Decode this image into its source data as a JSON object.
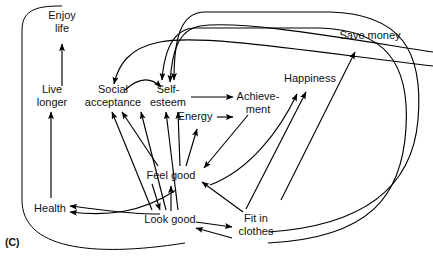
{
  "figure": {
    "panel_label": "(C)",
    "type": "causal-loop-diagram",
    "background_color": "#ffffff",
    "line_color": "#000000",
    "text_color": "#111111"
  },
  "nodes": [
    {
      "id": "enjoy-life",
      "lines": [
        "Enjoy",
        "life"
      ],
      "x": 62,
      "y": 22
    },
    {
      "id": "live-longer",
      "lines": [
        "Live",
        "longer"
      ],
      "x": 52,
      "y": 96
    },
    {
      "id": "social-acceptance",
      "lines": [
        "Social",
        "acceptance"
      ],
      "x": 113,
      "y": 96
    },
    {
      "id": "self-esteem",
      "lines": [
        "Self-",
        "esteem"
      ],
      "x": 168,
      "y": 96
    },
    {
      "id": "energy",
      "lines": [
        "Energy"
      ],
      "x": 195,
      "y": 117
    },
    {
      "id": "achievement",
      "lines": [
        "Achieve-",
        "ment"
      ],
      "x": 258,
      "y": 103
    },
    {
      "id": "happiness",
      "lines": [
        "Happiness"
      ],
      "x": 310,
      "y": 79
    },
    {
      "id": "save-money",
      "lines": [
        "Save money"
      ],
      "x": 370,
      "y": 36
    },
    {
      "id": "feel-good",
      "lines": [
        "Feel good"
      ],
      "x": 171,
      "y": 176
    },
    {
      "id": "look-good",
      "lines": [
        "Look good"
      ],
      "x": 170,
      "y": 220
    },
    {
      "id": "health",
      "lines": [
        "Health"
      ],
      "x": 50,
      "y": 209
    },
    {
      "id": "fit-in-clothes",
      "lines": [
        "Fit in",
        "clothes"
      ],
      "x": 256,
      "y": 225
    }
  ],
  "edges": [
    {
      "id": "health-to-live-longer",
      "from": "health",
      "to": "live-longer",
      "shape": "M 51 198 L 51 112",
      "arrow": "end"
    },
    {
      "id": "live-longer-to-enjoy-life",
      "from": "live-longer",
      "to": "enjoy-life",
      "shape": "M 62 86 L 62 44",
      "arrow": "end"
    },
    {
      "id": "social-acceptance-to-self-esteem",
      "from": "social-acceptance",
      "to": "self-esteem",
      "shape": "M 125 90 C 140 76, 152 78, 161 87",
      "arrow": "end"
    },
    {
      "id": "self-esteem-to-achievement",
      "from": "self-esteem",
      "to": "achievement",
      "shape": "M 191 97 L 233 97",
      "arrow": "end"
    },
    {
      "id": "energy-to-achievement",
      "from": "energy",
      "to": "achievement",
      "shape": "M 217 117 L 233 117",
      "arrow": "end"
    },
    {
      "id": "feel-good-to-energy",
      "from": "feel-good",
      "to": "energy",
      "shape": "M 186 166 L 197 129",
      "arrow": "end"
    },
    {
      "id": "achievement-to-feel-good",
      "from": "achievement",
      "to": "feel-good",
      "shape": "M 248 115 L 204 168",
      "arrow": "end"
    },
    {
      "id": "look-good-to-feel-good",
      "from": "look-good",
      "to": "feel-good",
      "shape": "M 171 211 L 171 186",
      "arrow": "end"
    },
    {
      "id": "fit-in-clothes-to-feel-good",
      "from": "fit-in-clothes",
      "to": "feel-good",
      "shape": "M 243 212 L 202 182",
      "arrow": "end"
    },
    {
      "id": "look-good-to-fit-in-clothes",
      "from": "look-good",
      "to": "fit-in-clothes",
      "shape": "M 196 222 L 232 227",
      "arrow": "end"
    },
    {
      "id": "fit-in-clothes-to-look-good",
      "from": "fit-in-clothes",
      "to": "look-good",
      "shape": "M 232 238 L 196 228",
      "arrow": "end"
    },
    {
      "id": "feel-good-to-happiness",
      "from": "feel-good",
      "to": "happiness",
      "shape": "M 210 185 C 250 170, 280 130, 297 94",
      "arrow": "end"
    },
    {
      "id": "fit-in-clothes-to-happiness",
      "from": "fit-in-clothes",
      "to": "happiness",
      "shape": "M 246 209 L 306 92",
      "arrow": "end"
    },
    {
      "id": "fit-in-clothes-to-save-money",
      "from": "fit-in-clothes",
      "to": "save-money",
      "shape": "M 281 200 L 355 52",
      "arrow": "end"
    },
    {
      "id": "feel-good-to-social-acceptance",
      "from": "feel-good",
      "to": "social-acceptance",
      "shape": "M 158 166 L 122 112",
      "arrow": "end"
    },
    {
      "id": "look-good-to-social-acceptance",
      "from": "look-good",
      "to": "social-acceptance",
      "shape": "M 152 210 L 112 112",
      "arrow": "end"
    },
    {
      "id": "look-good-to-self-esteem-a",
      "from": "look-good",
      "to": "self-esteem",
      "shape": "M 166 210 L 141 112",
      "arrow": "end"
    },
    {
      "id": "look-good-to-self-esteem-b",
      "from": "look-good",
      "to": "self-esteem",
      "shape": "M 178 210 L 166 112",
      "arrow": "end"
    },
    {
      "id": "feel-good-to-self-esteem",
      "from": "feel-good",
      "to": "self-esteem",
      "shape": "M 180 166 L 178 112",
      "arrow": "end"
    },
    {
      "id": "look-good-to-health",
      "from": "look-good",
      "to": "health",
      "shape": "M 160 214 C 120 214, 90 208, 70 206",
      "arrow": "end"
    },
    {
      "id": "feel-good-to-health",
      "from": "feel-good",
      "to": "health",
      "shape": "M 176 190 C 140 214, 105 216, 70 212",
      "arrow": "end"
    },
    {
      "id": "feel-good-to-look-good",
      "from": "feel-good",
      "to": "look-good",
      "shape": "M 152 184 C 156 196, 158 204, 160 210",
      "arrow": "end"
    },
    {
      "id": "health-loop-to-enjoy-life",
      "from": "health",
      "to": "enjoy-life",
      "shape": "M 185 243 C 90 258, 22 248, 22 200 L 22 30 C 22 8, 40 6, 62 6",
      "arrow": "none"
    },
    {
      "id": "save-money-loop-to-self-esteem",
      "from": "save-money",
      "to": "self-esteem",
      "shape": "M 268 232 C 360 226, 412 190, 418 120 C 424 50, 400 14, 330 12 L 205 12 C 180 12, 174 40, 174 80",
      "arrow": "end"
    },
    {
      "id": "happiness-loop-to-self-esteem",
      "from": "happiness",
      "to": "self-esteem",
      "shape": "M 268 243 C 370 238, 402 196, 406 128 C 410 62, 384 30, 320 28 L 196 28 C 172 28, 164 54, 162 80",
      "arrow": "end"
    },
    {
      "id": "outer-loop-to-social-acceptance",
      "from": "feel-good",
      "to": "social-acceptance",
      "shape": "M 433 66 C 300 50, 200 34, 160 42 C 128 48, 118 66, 114 84",
      "arrow": "end"
    },
    {
      "id": "top-loop-to-self-esteem",
      "from": "achievement",
      "to": "self-esteem",
      "shape": "M 433 52 C 330 36, 240 20, 200 26 C 178 30, 172 52, 170 82",
      "arrow": "end"
    }
  ]
}
